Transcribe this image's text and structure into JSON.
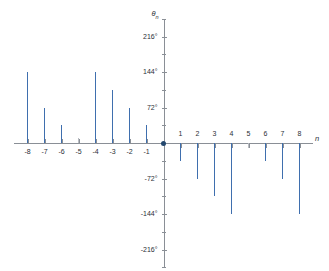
{
  "chart_data": {
    "type": "bar",
    "title": "",
    "subtitle": "",
    "xlabel": "n",
    "ylabel_symbol": "θ",
    "ylabel_subscript": "n",
    "ylabel": "θn",
    "categories": [
      -8,
      -7,
      -6,
      -5,
      -4,
      -3,
      -2,
      -1,
      0,
      1,
      2,
      3,
      4,
      5,
      6,
      7,
      8
    ],
    "values": [
      144,
      72,
      36,
      0,
      144,
      108,
      72,
      36,
      0,
      -36,
      -72,
      -108,
      -144,
      0,
      -36,
      -72,
      -144
    ],
    "unit": "degrees",
    "xlim": [
      -8.8,
      8.8
    ],
    "ylim": [
      -252,
      252
    ],
    "x_tick_labels": [
      "-8",
      "-7",
      "-6",
      "-5",
      "-4",
      "-3",
      "-2",
      "-1",
      "1",
      "2",
      "3",
      "4",
      "5",
      "6",
      "7",
      "8"
    ],
    "x_tick_values": [
      -8,
      -7,
      -6,
      -5,
      -4,
      -3,
      -2,
      -1,
      1,
      2,
      3,
      4,
      5,
      6,
      7,
      8
    ],
    "y_tick_labels": [
      "216°",
      "144°",
      "72°",
      "-72°",
      "-144°",
      "-216°"
    ],
    "y_tick_values": [
      216,
      144,
      72,
      -72,
      -144,
      -216
    ],
    "y_minor_tick_values": [
      252,
      180,
      108,
      36,
      -36,
      -108,
      -180,
      -252
    ],
    "grid": false,
    "legend": "none",
    "series": [
      {
        "name": "θn",
        "values": [
          144,
          72,
          36,
          0,
          144,
          108,
          72,
          36,
          0,
          -36,
          -72,
          -108,
          -144,
          0,
          -36,
          -72,
          -144
        ]
      }
    ],
    "zero_stems": [
      -5,
      5
    ],
    "origin_marker": {
      "x": 0,
      "y": 0
    },
    "colors": {
      "stem": "#3f6fae",
      "zero_stem": "#b9bcc2",
      "axis": "#8a8f96",
      "origin_dot": "#24486f",
      "text": "#2b2f36",
      "background": "#ffffff"
    }
  }
}
